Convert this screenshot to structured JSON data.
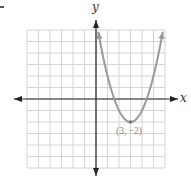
{
  "chart_data": {
    "type": "line",
    "title": "",
    "xlabel": "x",
    "ylabel": "y",
    "xlim": [
      -6,
      6
    ],
    "ylim": [
      -6,
      6
    ],
    "grid": true,
    "function": "y = (x - 3)^2 - 2",
    "series": [
      {
        "name": "parabola",
        "color": "#9a9a9a",
        "x": [
          0.2,
          1,
          2,
          3,
          4,
          5,
          5.8
        ],
        "y": [
          5.84,
          2,
          -1,
          -2,
          -1,
          2,
          5.84
        ]
      }
    ],
    "annotations": [
      {
        "text": "(3, −2)",
        "x": 3,
        "y": -2
      }
    ]
  },
  "labels": {
    "x_axis": "x",
    "y_axis": "y",
    "vertex": "(3, −2)"
  }
}
